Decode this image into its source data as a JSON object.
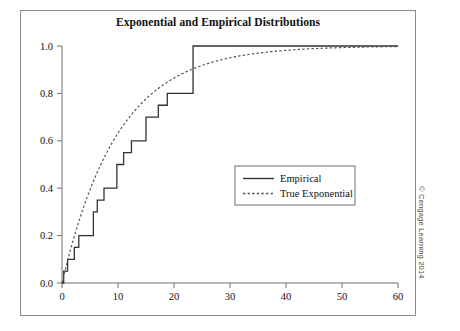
{
  "figure": {
    "title": "Exponential and Empirical Distributions",
    "credit": "© Cengage Learning 2014"
  },
  "legend": {
    "items": [
      {
        "label": "Empirical",
        "style": "solid",
        "color": "#333333"
      },
      {
        "label": "True Exponential",
        "style": "dashed",
        "color": "#555555"
      }
    ]
  },
  "axes": {
    "x_ticks": [
      "0",
      "10",
      "20",
      "30",
      "40",
      "50",
      "60"
    ],
    "y_ticks": [
      "0.0",
      "0.2",
      "0.4",
      "0.6",
      "0.8",
      "1.0"
    ]
  },
  "chart_data": {
    "type": "line",
    "title": "Exponential and Empirical Distributions",
    "xlabel": "",
    "ylabel": "",
    "xlim": [
      0,
      60
    ],
    "ylim": [
      0,
      1.0
    ],
    "xticks": [
      0,
      10,
      20,
      30,
      40,
      50,
      60
    ],
    "yticks": [
      0.0,
      0.2,
      0.4,
      0.6,
      0.8,
      1.0
    ],
    "grid": false,
    "legend_position": "center-right",
    "series": [
      {
        "name": "Empirical",
        "type": "step",
        "style": "solid",
        "color": "#333333",
        "comment": "Empirical CDF step function; each jump of 0.05 occurs at an observed sample value.",
        "jump_points": [
          0.3,
          1.0,
          1.5,
          2.2,
          3.0,
          4.2,
          5.6,
          6.3,
          7.5,
          8.6,
          9.8,
          11.0,
          12.4,
          14.2,
          15.0,
          17.2,
          18.8,
          20.2,
          23.4
        ],
        "x": [
          0,
          0.3,
          1.0,
          1.5,
          2.2,
          3.0,
          4.2,
          5.6,
          6.3,
          7.5,
          8.6,
          9.8,
          11.0,
          12.4,
          14.2,
          15.0,
          17.2,
          18.8,
          20.2,
          23.4,
          60
        ],
        "y": [
          0.0,
          0.05,
          0.1,
          0.1,
          0.15,
          0.2,
          0.2,
          0.3,
          0.35,
          0.4,
          0.4,
          0.5,
          0.55,
          0.6,
          0.6,
          0.7,
          0.75,
          0.8,
          0.8,
          1.0,
          1.0
        ]
      },
      {
        "name": "True Exponential",
        "type": "curve",
        "style": "dashed",
        "color": "#555555",
        "comment": "True exponential CDF F(x) = 1 - exp(-x/mean), mean approximately 10.",
        "function": "1 - exp(-x/10)",
        "mean": 10,
        "x": [
          0,
          2,
          4,
          6,
          8,
          10,
          12,
          14,
          16,
          18,
          20,
          24,
          28,
          32,
          36,
          40,
          45,
          50,
          55,
          60
        ],
        "y": [
          0.0,
          0.181,
          0.33,
          0.451,
          0.551,
          0.632,
          0.699,
          0.753,
          0.798,
          0.835,
          0.865,
          0.909,
          0.939,
          0.959,
          0.973,
          0.982,
          0.989,
          0.993,
          0.996,
          0.998
        ]
      }
    ]
  }
}
